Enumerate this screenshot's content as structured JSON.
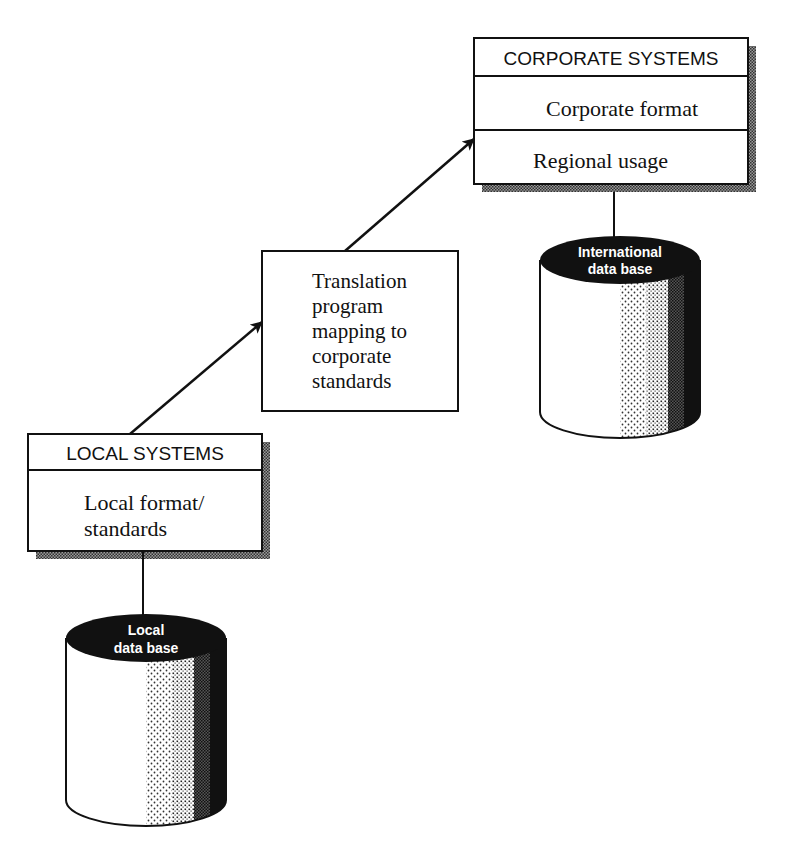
{
  "corporate_systems": {
    "header": "CORPORATE SYSTEMS",
    "row1": "Corporate format",
    "row2": "Regional usage"
  },
  "international_db": {
    "line1": "International",
    "line2": "data base"
  },
  "translation": {
    "lines": [
      "Translation",
      "program",
      "mapping to",
      "corporate",
      "standards"
    ]
  },
  "local_systems": {
    "header": "LOCAL SYSTEMS",
    "row1_line1": "Local format/",
    "row1_line2": "standards"
  },
  "local_db": {
    "line1": "Local",
    "line2": "data base"
  },
  "colors": {
    "ink": "#111111",
    "paper": "#ffffff",
    "shadow": "#555555"
  }
}
